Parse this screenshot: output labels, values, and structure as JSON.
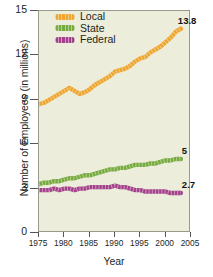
{
  "chart_data": {
    "type": "line",
    "title": "",
    "xlabel": "Year",
    "ylabel": "Number of Employees (in millions)",
    "xlim": [
      1975,
      2005
    ],
    "ylim": [
      0,
      15
    ],
    "xticks": [
      1975,
      1980,
      1985,
      1990,
      1995,
      2000,
      2005
    ],
    "yticks": [
      0,
      3,
      6,
      9,
      12,
      15
    ],
    "grid": false,
    "legend_position": "top-left",
    "plot_background": "#eceedb",
    "series": [
      {
        "name": "Local",
        "color": "#f0a52e",
        "end_label": "13.8",
        "x": [
          1975,
          1976,
          1977,
          1978,
          1979,
          1980,
          1981,
          1982,
          1983,
          1984,
          1985,
          1986,
          1987,
          1988,
          1989,
          1990,
          1991,
          1992,
          1993,
          1994,
          1995,
          1996,
          1997,
          1998,
          1999,
          2000,
          2001,
          2002,
          2003
        ],
        "values": [
          8.7,
          8.8,
          9.0,
          9.2,
          9.4,
          9.6,
          9.8,
          9.6,
          9.4,
          9.5,
          9.7,
          10.0,
          10.2,
          10.4,
          10.6,
          10.9,
          11.0,
          11.1,
          11.3,
          11.6,
          11.8,
          11.9,
          12.2,
          12.4,
          12.6,
          12.9,
          13.2,
          13.6,
          13.8
        ]
      },
      {
        "name": "State",
        "color": "#76ab3f",
        "end_label": "5",
        "x": [
          1975,
          1976,
          1977,
          1978,
          1979,
          1980,
          1981,
          1982,
          1983,
          1984,
          1985,
          1986,
          1987,
          1988,
          1989,
          1990,
          1991,
          1992,
          1993,
          1994,
          1995,
          1996,
          1997,
          1998,
          1999,
          2000,
          2001,
          2002,
          2003
        ],
        "values": [
          3.3,
          3.4,
          3.4,
          3.5,
          3.5,
          3.6,
          3.7,
          3.7,
          3.8,
          3.9,
          3.9,
          4.0,
          4.1,
          4.2,
          4.3,
          4.3,
          4.4,
          4.4,
          4.5,
          4.6,
          4.6,
          4.6,
          4.7,
          4.7,
          4.8,
          4.9,
          4.9,
          5.0,
          5.0
        ]
      },
      {
        "name": "Federal",
        "color": "#a4408e",
        "end_label": "2.7",
        "x": [
          1975,
          1976,
          1977,
          1978,
          1979,
          1980,
          1981,
          1982,
          1983,
          1984,
          1985,
          1986,
          1987,
          1988,
          1989,
          1990,
          1991,
          1992,
          1993,
          1994,
          1995,
          1996,
          1997,
          1998,
          1999,
          2000,
          2001,
          2002,
          2003
        ],
        "values": [
          2.9,
          2.9,
          2.9,
          3.0,
          2.9,
          3.0,
          3.0,
          2.9,
          3.0,
          3.0,
          3.1,
          3.1,
          3.1,
          3.1,
          3.1,
          3.2,
          3.1,
          3.1,
          3.0,
          2.9,
          2.9,
          2.8,
          2.8,
          2.8,
          2.8,
          2.8,
          2.7,
          2.7,
          2.7
        ]
      }
    ]
  },
  "caption": ""
}
